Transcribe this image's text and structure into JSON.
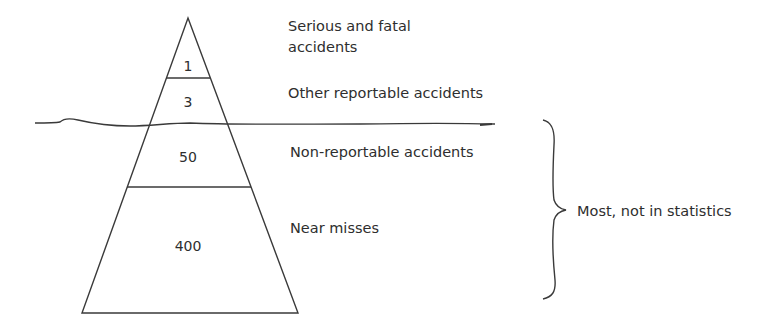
{
  "diagram": {
    "type": "accident-iceberg-pyramid",
    "tiers": [
      {
        "value": "1",
        "label_line1": "Serious and fatal",
        "label_line2": "accidents"
      },
      {
        "value": "3",
        "label": "Other reportable accidents"
      },
      {
        "value": "50",
        "label": "Non-reportable accidents"
      },
      {
        "value": "400",
        "label": "Near misses"
      }
    ],
    "brace_label": "Most, not in statistics",
    "colors": {
      "stroke": "#3a3a3a",
      "text": "#2e2e2e",
      "background": "#ffffff"
    }
  }
}
